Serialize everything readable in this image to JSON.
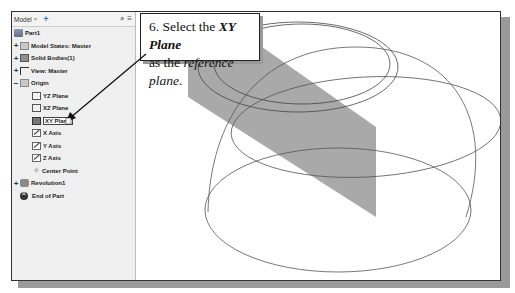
{
  "browser": {
    "tab_label": "Model",
    "tab_close": "×",
    "tab_add": "+",
    "search_icon": "⌕",
    "menu_icon": "≡",
    "items": [
      {
        "label": "Part1",
        "icon": "part-icon",
        "expand": "",
        "level": 0
      },
      {
        "label": "Model States: Master",
        "icon": "folder-icon",
        "expand": "+",
        "level": 0
      },
      {
        "label": "Solid Bodies(1)",
        "icon": "solid-bodies-icon",
        "expand": "+",
        "level": 0
      },
      {
        "label": "View: Master",
        "icon": "view-icon",
        "expand": "+",
        "level": 0
      },
      {
        "label": "Origin",
        "icon": "folder-icon",
        "expand": "−",
        "level": 0
      },
      {
        "label": "YZ Plane",
        "icon": "plane-icon",
        "expand": "",
        "level": 1
      },
      {
        "label": "XZ Plane",
        "icon": "plane-icon",
        "expand": "",
        "level": 1
      },
      {
        "label": "XY Plane",
        "icon": "plane-icon",
        "expand": "",
        "level": 1,
        "selected": true
      },
      {
        "label": "X Axis",
        "icon": "axis-icon",
        "expand": "",
        "level": 1
      },
      {
        "label": "Y Axis",
        "icon": "axis-icon",
        "expand": "",
        "level": 1
      },
      {
        "label": "Z Axis",
        "icon": "axis-icon",
        "expand": "",
        "level": 1
      },
      {
        "label": "Center Point",
        "icon": "point-icon",
        "expand": "",
        "level": 1
      },
      {
        "label": "Revolution1",
        "icon": "revolution-icon",
        "expand": "+",
        "level": 0
      },
      {
        "label": "End of Part",
        "icon": "end-of-part-icon",
        "expand": "",
        "level": 0
      }
    ]
  },
  "callout": {
    "step": "6. Select the ",
    "bold_italic": "XY Plane",
    "line2_prefix": "as the ",
    "italic": "reference plane",
    "line2_suffix": "."
  },
  "colors": {
    "plane_fill": "#a9a9a9",
    "panel_bg": "#efefef",
    "outline": "#333333"
  }
}
